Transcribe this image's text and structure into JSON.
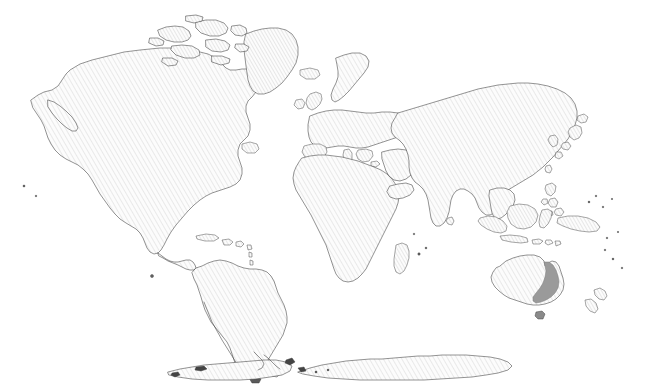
{
  "map": {
    "title": "World Map",
    "projection": "equirectangular",
    "width": 650,
    "height": 391,
    "background_color": "#ffffff",
    "land_fill_pattern": "diagonal-hatch",
    "land_hatch_color": "#d9d9d9",
    "land_base_color": "#fbfbfb",
    "coastline_color": "#3a3a3a",
    "highlight_color": "#9a9a9a",
    "highlight_outline_color": "#7d7d7d",
    "has_labels": false,
    "has_legend": false,
    "has_graticule": false
  },
  "highlight": {
    "name": "eastern-australia",
    "region_label": "Eastern Australia",
    "continent": "Oceania",
    "description": "Solid medium-gray band along the east coast of Australia from Cape York Peninsula south to Victoria",
    "fill_color": "#9a9a9a"
  },
  "continents": [
    {
      "name": "north-america",
      "label": "North America"
    },
    {
      "name": "south-america",
      "label": "South America"
    },
    {
      "name": "europe",
      "label": "Europe"
    },
    {
      "name": "africa",
      "label": "Africa"
    },
    {
      "name": "asia",
      "label": "Asia"
    },
    {
      "name": "oceania",
      "label": "Oceania"
    },
    {
      "name": "antarctica",
      "label": "Antarctica"
    }
  ],
  "landmasses": [
    {
      "name": "greenland",
      "label": "Greenland"
    },
    {
      "name": "canadian-arctic-archipelago",
      "label": "Canadian Arctic Archipelago"
    },
    {
      "name": "iceland",
      "label": "Iceland"
    },
    {
      "name": "british-isles",
      "label": "British Isles"
    },
    {
      "name": "scandinavia",
      "label": "Scandinavia"
    },
    {
      "name": "madagascar",
      "label": "Madagascar"
    },
    {
      "name": "arabian-peninsula",
      "label": "Arabian Peninsula"
    },
    {
      "name": "india",
      "label": "India"
    },
    {
      "name": "sri-lanka",
      "label": "Sri Lanka"
    },
    {
      "name": "japan",
      "label": "Japan"
    },
    {
      "name": "philippines",
      "label": "Philippines"
    },
    {
      "name": "borneo",
      "label": "Borneo"
    },
    {
      "name": "sumatra",
      "label": "Sumatra"
    },
    {
      "name": "java",
      "label": "Java"
    },
    {
      "name": "sulawesi",
      "label": "Sulawesi"
    },
    {
      "name": "new-guinea",
      "label": "New Guinea"
    },
    {
      "name": "australia",
      "label": "Australia"
    },
    {
      "name": "new-zealand",
      "label": "New Zealand"
    },
    {
      "name": "tasmania",
      "label": "Tasmania"
    },
    {
      "name": "caribbean-islands",
      "label": "Caribbean Islands"
    },
    {
      "name": "antarctic-peninsula",
      "label": "Antarctic Peninsula"
    }
  ]
}
